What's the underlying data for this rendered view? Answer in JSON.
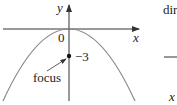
{
  "diagram": {
    "axes": {
      "x_label": "x",
      "y_label": "y",
      "origin_label": "0"
    },
    "curve": {
      "type": "parabola",
      "opens": "down",
      "vertex": [
        0,
        0
      ]
    },
    "focus": {
      "label": "focus",
      "value_label": "−3",
      "y": -3
    },
    "right_panel": {
      "partial_label": "dir",
      "x_label": "x"
    },
    "colors": {
      "curve": "#8a8a8a",
      "axes": "#333333",
      "text": "#222222"
    }
  }
}
